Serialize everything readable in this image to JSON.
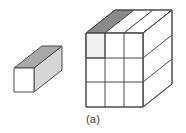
{
  "figure": {
    "caption": "(a)",
    "background_color": "#ffffff",
    "stroke_color": "#4a4a4a",
    "stroke_width": 1,
    "colors": {
      "face_white": "#ffffff",
      "face_light_gray": "#f0f0f0",
      "face_medium_gray": "#a8a8a8",
      "face_dark_gray": "#8a8a8a",
      "face_side_gray": "#e0e0e0",
      "outline": "#4a4a4a",
      "caption_text": "#3c3c3c"
    },
    "unit_block": {
      "name": "unit-rectangular-prism",
      "front_face": {
        "points": "14,68 34,68 34,92 14,92",
        "fill": "#ffffff"
      },
      "top_face": {
        "points": "14,68 42,46 62,46 34,68",
        "fill": "#a8a8a8"
      },
      "right_face": {
        "points": "34,68 62,46 62,70 34,92",
        "fill": "#d6d6d6"
      },
      "depth_offset": {
        "dx": 28,
        "dy": -22
      }
    },
    "large_cube": {
      "name": "three-by-three-by-three-cube",
      "divisions": 3,
      "front_face": {
        "points": "86,33 143,33 143,107 86,107",
        "fill": "#ffffff",
        "cells_x": [
          86,
          105,
          124,
          143
        ],
        "cells_y": [
          33,
          58,
          82,
          107
        ],
        "highlighted_cell": {
          "row": 0,
          "col": 0,
          "fill": "#f0f0f0"
        }
      },
      "top_face": {
        "points": "86,33 115,10 172,10 143,33",
        "fill": "#ffffff",
        "strips": [
          {
            "points": "86,33 115,10 134,10 105,33",
            "fill": "#8a8a8a",
            "shaded": true
          },
          {
            "points": "105,33 134,10 153,10 124,33",
            "fill": "#ffffff",
            "shaded": false
          },
          {
            "points": "124,33 153,10 172,10 143,33",
            "fill": "#ffffff",
            "shaded": false
          }
        ]
      },
      "right_face": {
        "points": "143,33 172,10 172,84 143,107",
        "fill": "#ffffff",
        "row_lines": [
          "143,58 172,35",
          "143,82 172,59"
        ]
      },
      "depth_offset": {
        "dx": 29,
        "dy": -23
      }
    }
  }
}
